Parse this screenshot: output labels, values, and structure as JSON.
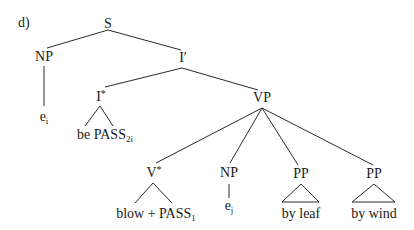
{
  "example": {
    "label": "d)"
  },
  "tree": {
    "root": {
      "label": "S",
      "children": [
        "NP",
        "I′"
      ]
    },
    "nodes": {
      "s": {
        "label": "S"
      },
      "np_subject": {
        "label": "NP"
      },
      "e_i_subject": {
        "base": "e",
        "sub": "i"
      },
      "i_bar": {
        "label": "I′"
      },
      "i_star": {
        "base": "I",
        "sup": "*"
      },
      "be_pass": {
        "base": "be PASS",
        "sub": "2i"
      },
      "vp": {
        "label": "VP"
      },
      "v_star": {
        "base": "V",
        "sup": "*"
      },
      "blow_pass": {
        "base": "blow + PASS",
        "sub": "1"
      },
      "np_object": {
        "label": "NP"
      },
      "e_j_object": {
        "base": "e",
        "sub": "j"
      },
      "pp_leaf": {
        "label": "PP"
      },
      "by_leaf": {
        "label": "by leaf"
      },
      "pp_wind": {
        "label": "PP"
      },
      "by_wind": {
        "label": "by wind"
      }
    },
    "structure": "[S [NP e_i] [I′ [I* be PASS_2i] [VP [V* blow + PASS_1] [NP e_j] [PP by leaf] [PP by wind]]]]"
  },
  "colors": {
    "line": "#2a2a2a",
    "text": "#1a1a1a",
    "background": "#ffffff"
  }
}
